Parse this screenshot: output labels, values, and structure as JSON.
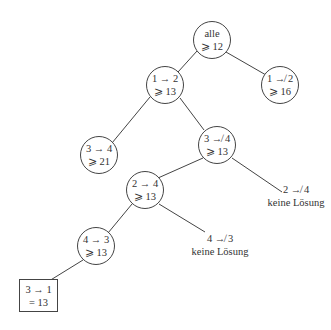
{
  "tree": {
    "root": {
      "line1": "alle",
      "line2": "⩾ 12"
    },
    "n_1_2": {
      "line1": "1 → 2",
      "line2": "⩾ 13"
    },
    "n_not_1_2": {
      "line1": "1 ↛ 2",
      "line2": "⩾ 16"
    },
    "n_3_4": {
      "line1": "3 → 4",
      "line2": "⩾ 21"
    },
    "n_not_3_4": {
      "line1": "3 ↛ 4",
      "line2": "⩾ 13"
    },
    "leaf_not_2_4": {
      "line1": "2 ↛ 4",
      "line2": "keine Lösung"
    },
    "n_2_4": {
      "line1": "2 → 4",
      "line2": "⩾ 13"
    },
    "leaf_not_4_3": {
      "line1": "4 ↛ 3",
      "line2": "keine Lösung"
    },
    "n_4_3": {
      "line1": "4 → 3",
      "line2": "⩾ 13"
    },
    "solution": {
      "line1": "3 → 1",
      "line2": "= 13"
    }
  },
  "colors": {
    "stroke": "#444444",
    "text": "#333333",
    "background": "#ffffff"
  }
}
